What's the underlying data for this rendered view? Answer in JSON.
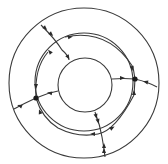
{
  "diagram": {
    "type": "concentric-annulus-flow",
    "colors": {
      "stroke": "#3a3a3a",
      "arrow": "#2a2a2a",
      "node": "#1a1a1a",
      "background": "#ffffff"
    },
    "rings": [
      {
        "name": "outer",
        "cx": 84,
        "cy": 83,
        "r": 75
      },
      {
        "name": "middle",
        "cx": 84,
        "cy": 82,
        "r": 49
      },
      {
        "name": "inner",
        "cx": 85,
        "cy": 85,
        "r": 27
      }
    ],
    "nodes": [
      {
        "name": "right-node",
        "x": 135,
        "y": 79
      },
      {
        "name": "left-node",
        "x": 36,
        "y": 98
      }
    ],
    "paths": [
      {
        "name": "top-left-radial",
        "d": "M 41 25 Q 56 40 62 50 Q 68 55 69 60"
      },
      {
        "name": "right-inner-to-node",
        "d": "M 112 79 Q 124 78 135 79"
      },
      {
        "name": "right-node-to-outer",
        "d": "M 135 79 Q 148 82 157 87"
      },
      {
        "name": "middle-arc-top-to-right-node",
        "d": "M 65 37 Q 108 28 133 67 L 135 79"
      },
      {
        "name": "right-node-down",
        "d": "M 135 79 L 134 95"
      },
      {
        "name": "left-node-to-inner",
        "d": "M 36 98 Q 47 93 58 91"
      },
      {
        "name": "left-node-to-outer",
        "d": "M 36 98 Q 25 103 14 109"
      },
      {
        "name": "left-middle-arc-down",
        "d": "M 48 52 Q 34 68 36 98"
      },
      {
        "name": "left-node-lower-arc",
        "d": "M 36 98 Q 42 118 58 128 Q 78 138 98 134 Q 115 131 134 95"
      },
      {
        "name": "bottom-radial",
        "d": "M 95 112 Q 100 125 102 137 Q 104 148 105 157"
      }
    ],
    "arrows": [
      {
        "x": 45,
        "y": 28,
        "angle": 45
      },
      {
        "x": 51,
        "y": 34,
        "angle": 45
      },
      {
        "x": 68,
        "y": 57,
        "angle": 60
      },
      {
        "x": 70,
        "y": 37,
        "angle": -10
      },
      {
        "x": 50,
        "y": 52,
        "angle": 230
      },
      {
        "x": 122,
        "y": 78,
        "angle": 0
      },
      {
        "x": 146,
        "y": 82,
        "angle": 195
      },
      {
        "x": 132,
        "y": 68,
        "angle": 80
      },
      {
        "x": 134,
        "y": 93,
        "angle": 270
      },
      {
        "x": 36,
        "y": 86,
        "angle": 90
      },
      {
        "x": 50,
        "y": 93,
        "angle": 190
      },
      {
        "x": 20,
        "y": 106,
        "angle": 200
      },
      {
        "x": 40,
        "y": 112,
        "angle": 250
      },
      {
        "x": 96,
        "y": 116,
        "angle": 75
      },
      {
        "x": 98,
        "y": 121,
        "angle": 75
      },
      {
        "x": 93,
        "y": 134,
        "angle": 180
      },
      {
        "x": 112,
        "y": 128,
        "angle": -30
      },
      {
        "x": 104,
        "y": 146,
        "angle": 270
      },
      {
        "x": 104,
        "y": 151,
        "angle": 270
      }
    ]
  }
}
